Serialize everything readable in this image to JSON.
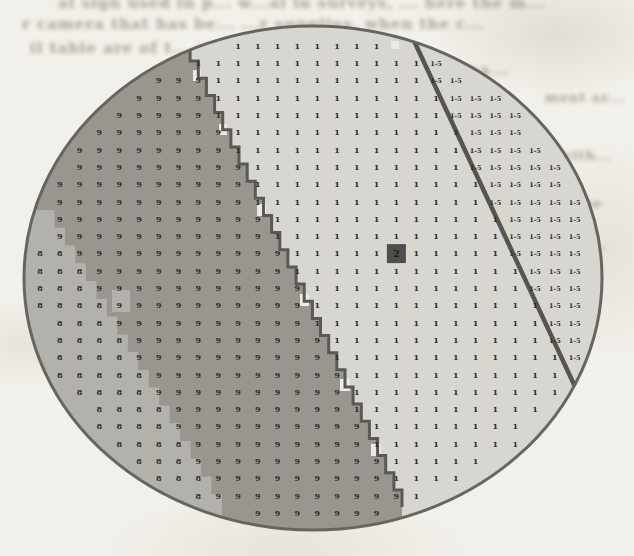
{
  "page": {
    "background": "#f2f0ea"
  },
  "faint_text_fragments": [
    {
      "text": "al sign used in p...  w...al in surveys, ...  here the m...",
      "x": 58,
      "y": -6,
      "size": 15
    },
    {
      "text": "r camera that has be...  ...r supplies, when the c...",
      "x": 22,
      "y": 15,
      "size": 15
    },
    {
      "text": "il table are of t...  v...  ...selected area p...",
      "x": 30,
      "y": 39,
      "size": 15
    },
    {
      "text": "In large ...  ...  terna...",
      "x": 310,
      "y": 61,
      "size": 15
    },
    {
      "text": "ment ar...",
      "x": 545,
      "y": 90,
      "size": 13
    },
    {
      "text": "with...",
      "x": 560,
      "y": 148,
      "size": 13
    },
    {
      "text": "n, the",
      "x": 554,
      "y": 196,
      "size": 13
    },
    {
      "text": "by wi...",
      "x": 548,
      "y": 238,
      "size": 13
    }
  ],
  "map": {
    "ellipse": {
      "cx": 313,
      "cy": 278,
      "rx": 289,
      "ry": 252,
      "border_color": "#67655f",
      "border_width": 3,
      "label_margin_x": 12,
      "label_margin_y": 9
    },
    "zones": {
      "unit1": {
        "label": "1",
        "color": "#d8d6d0"
      },
      "unit8": {
        "label": "8",
        "color": "#b3b1ab"
      },
      "unit9": {
        "label": "9",
        "color": "#98968f"
      },
      "unit15": {
        "label": "1-5",
        "color": "#d8d6d0"
      }
    },
    "boundaries": {
      "line_9_1": {
        "from": [
          182,
          44
        ],
        "to": [
          402,
          507
        ],
        "stroke": "#5a5955",
        "width": 3,
        "steps": 27
      },
      "line_1_15": {
        "from": [
          409,
          30
        ],
        "to": [
          578,
          393
        ],
        "stroke": "#56554f",
        "width": 4.5
      },
      "edge_8_9": {
        "from": [
          44,
          210
        ],
        "to": [
          222,
          512
        ],
        "steps": 17
      }
    },
    "grid": {
      "x0": 40,
      "y0": 46,
      "dx": 19.8,
      "dy": 17.3,
      "cols": 29,
      "rows": 28,
      "label_color": "#2e2c28",
      "font_size": 8,
      "font_size_range_label": 6.5
    },
    "selected_cell": {
      "cx": 396.4,
      "cy": 253.6,
      "size": 19,
      "color": "#504e4a",
      "label": "2",
      "label_color": "#1c1a17"
    },
    "patches": [
      {
        "x": 391,
        "y": 41,
        "w": 8,
        "h": 8,
        "fill": "#eceae4"
      },
      {
        "x": 443,
        "y": 40,
        "w": 7,
        "h": 7,
        "fill": "#eceae4"
      },
      {
        "x": 193,
        "y": 70,
        "w": 8,
        "h": 11,
        "fill": "#eceae4"
      },
      {
        "x": 219,
        "y": 124,
        "w": 8,
        "h": 11,
        "fill": "#eceae4"
      },
      {
        "x": 257,
        "y": 204,
        "w": 9,
        "h": 12,
        "fill": "#eceae4"
      },
      {
        "x": 300,
        "y": 294,
        "w": 9,
        "h": 12,
        "fill": "#eceae4"
      },
      {
        "x": 340,
        "y": 379,
        "w": 10,
        "h": 12,
        "fill": "#eceae4"
      },
      {
        "x": 371,
        "y": 444,
        "w": 10,
        "h": 12,
        "fill": "#eceae4"
      },
      {
        "x": 112,
        "y": 290,
        "w": 18,
        "h": 22,
        "fill": "#b3b1ab"
      },
      {
        "x": 50,
        "y": 336,
        "w": 12,
        "h": 12,
        "fill": "#b3b1ab"
      }
    ]
  }
}
